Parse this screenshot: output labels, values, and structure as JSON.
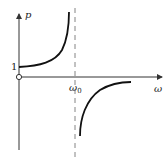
{
  "figure": {
    "y_axis_label": "p",
    "x_axis_label": "ω",
    "y_tick_label": "1",
    "x_marker_label": "ω0",
    "x_marker_label_main": "ω",
    "x_marker_label_sub": "0",
    "colors": {
      "curve": "#111111",
      "axis": "#333333",
      "asymptote": "#777777",
      "background": "#ffffff"
    }
  }
}
